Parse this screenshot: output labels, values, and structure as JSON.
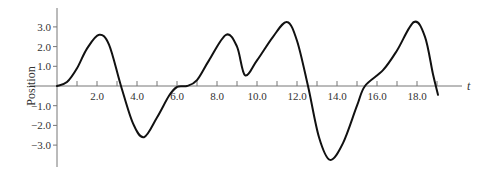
{
  "chart_data": {
    "type": "line",
    "title": "",
    "xlabel": "t",
    "ylabel": "Position",
    "xlim": [
      0,
      20
    ],
    "ylim": [
      -4.0,
      4.0
    ],
    "grid": false,
    "legend": null,
    "x_ticks": [
      1.0,
      2.0,
      3.0,
      4.0,
      5.0,
      6.0,
      7.0,
      8.0,
      9.0,
      10.0,
      11.0,
      12.0,
      13.0,
      14.0,
      15.0,
      16.0,
      17.0,
      18.0,
      19.0
    ],
    "x_tick_labels": [
      "2.0",
      "4.0",
      "6.0",
      "8.0",
      "10.0",
      "12.0",
      "14.0",
      "16.0",
      "18.0"
    ],
    "x_tick_label_values": [
      2.0,
      4.0,
      6.0,
      8.0,
      10.0,
      12.0,
      14.0,
      16.0,
      18.0
    ],
    "y_ticks": [
      3.0,
      2.0,
      1.0,
      -1.0,
      -2.0,
      -3.0
    ],
    "y_tick_labels": [
      "3.0",
      "2.0",
      "1.0",
      "−1.0",
      "−2.0",
      "−3.0"
    ],
    "series": [
      {
        "name": "Position",
        "x": [
          0.0,
          0.5,
          1.0,
          1.5,
          2.1,
          2.6,
          3.2,
          3.8,
          4.35,
          5.0,
          5.6,
          6.0,
          6.5,
          7.0,
          7.6,
          8.45,
          9.0,
          9.4,
          10.0,
          10.8,
          11.5,
          12.0,
          12.55,
          13.1,
          13.65,
          14.3,
          15.0,
          15.4,
          16.3,
          17.0,
          17.85,
          18.4,
          18.8,
          19.05
        ],
        "y": [
          0.0,
          0.2,
          0.9,
          1.9,
          2.6,
          2.1,
          0.0,
          -1.9,
          -2.6,
          -1.6,
          -0.5,
          -0.05,
          0.0,
          0.3,
          1.3,
          2.6,
          2.0,
          0.55,
          1.3,
          2.5,
          3.25,
          2.3,
          0.0,
          -2.6,
          -3.75,
          -2.9,
          -1.0,
          0.0,
          0.8,
          1.8,
          3.25,
          2.5,
          0.6,
          -0.45
        ]
      }
    ]
  }
}
